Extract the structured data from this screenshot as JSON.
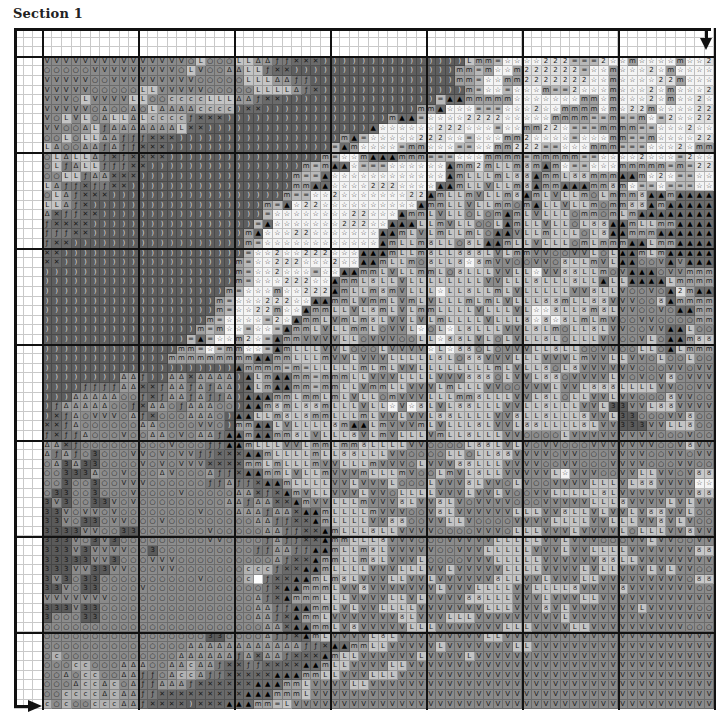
{
  "header": {
    "title": "Section 1"
  },
  "chart": {
    "cell_px": 9.6,
    "margin_cols": 3,
    "margin_rows": 3,
    "cols": 70,
    "rows": 68,
    "bold_every": 10,
    "arrows": {
      "top_right": "down-arrow",
      "bottom_left": "right-arrow"
    }
  },
  "legend": {
    "v": {
      "glyph": "V",
      "bg": "#8a8a8a",
      "name": "v-symbol"
    },
    "o": {
      "glyph": "○",
      "bg": "#8c8c8c",
      "name": "circle-symbol"
    },
    "l": {
      "glyph": "L",
      "bg": "#c4c4c4",
      "name": "l-symbol"
    },
    "a": {
      "glyph": "Δ",
      "bg": "#9a9a9a",
      "name": "triangle-outline-symbol"
    },
    "f": {
      "glyph": "ƒ",
      "bg": "#7a7a7a",
      "name": "f-symbol"
    },
    "x": {
      "glyph": "✕",
      "bg": "#6a6a6a",
      "name": "cross-symbol"
    },
    "c": {
      "glyph": "c",
      "bg": "#b2b2b2",
      "name": "c-symbol"
    },
    ")": {
      "glyph": ")",
      "bg": "#5e5e5e",
      "name": "paren-symbol"
    },
    "m": {
      "glyph": "m",
      "bg": "#a0a0a0",
      "name": "m-symbol"
    },
    "=": {
      "glyph": "=",
      "bg": "#b8b8b8",
      "name": "equals-symbol"
    },
    "s": {
      "glyph": "☆",
      "bg": "#f4f4f4",
      "name": "star-symbol"
    },
    "2": {
      "glyph": "2",
      "bg": "#dedede",
      "name": "two-symbol"
    },
    "^": {
      "glyph": "▲",
      "bg": "#6c6c6c",
      "name": "filled-triangle-symbol"
    },
    "5": {
      "glyph": "ठ",
      "bg": "#c8c8c8",
      "name": "curl-symbol"
    },
    "3": {
      "glyph": "3",
      "bg": "#5a5a5a",
      "name": "three-symbol"
    },
    ".": {
      "glyph": "",
      "bg": "#ffffff",
      "name": "empty"
    }
  },
  "pattern_rows": [
    "vvvvvvvvvvvvvvvolooollaaffxxx)))))))))))))))lmm=ssss222===2ssmssssmss2ss2",
    "ooooovvvvvvvvvolvooaallfxx)))))))))))))))))mm=mssm222222=ssmsss2smssss2",
    "vvvvvoovvvvvvvvvooooolllaaff)))))))))))))))mm=ssmm2222222ssmssss22msss2",
    "vvvvvooooollvvvvvooooollllafx)))))))))))))))m=ss=sssm==2sssmsss2smsss2",
    "vvvolvvvvlloocccclllaafxx))))))))))))))))=^^mmmmmsssssssmmsmsss2smss2s",
    "vvvvvoaooaolaaaacccc)xx))))))))))))))))mm^sss===sss2ssmmmmsms22mssss2",
    "volvloallalccccfxxx)))))))))))))))))m^^=ssss2222sssssmmmm==m==ms=2ss2",
    "vvooalfaaaaaaalxx)))))))))))))))))^ssssss222sss=ssmm22s===mmmm==sss2s",
    "oolollaafffxxx)))))))))))))))))m^=sssss222ss=sssmm2ssss=sssmm==mssss2",
    "laooaafaffxxx)))))))))))))))))=^mssss=mmsss==ssmm222==sssmmm===sss2sm",
    "olallafxfxxxx))))))))))))))))m=ssm^^^mmm===sssmmmm=mmmmm==ssss2sss=2s",
    "olfallfffxx))))))))))))))))m=m^^s===ssssss^mm2mllm5m^ms==sssmmmmm=m=2",
    "oollfaaxxx))))))))))))))))m==^ssssssssssss^mlllml55^mml55mmm^^ms2s==s",
    "laffxffxx)))))))))))))))))mm^^ssss222ssss^^mllvllm5^mm^^^mm5ms==s===s",
    "olafxxx))))))))))))))))))m==ss2sssssss22^mllmvllm5^mlvllmolmmm5^^m^^^",
    "llafx))))))))))))))))))m=^s22ssssssssss^mmllvllmmom^llvllmomm55^m^^^^",
    "axffxx)))))))))))))))))=ssssssss22sss^mmlvllolom^mlvlllommomlm^^^^^^",
    "fxxxx)))))))))))))))))=^sssssss222ss^^^llmvllool^mllvllol55^^mllmm^^^",
    "fffxx))))))))))))))))m^sss22sssssss^^mlvlmllmlo^^vllmlllol5^^mmm^^^^",
    "fxx))))))))))))))))))m=ssssssssssss^mllm5llo5l^^mllvlllomlmmm^^lmm^^^",
    "xx)))))))))))))))))))=ss2ss222sss^^^mllm5ll555lvlmmvvoovvlol^^mlm^^^^",
    "xx))))))))))))))))))m=ss222sss2ss^^mllmo5ll5s5mvvoovvo5llmvl^^oov^v^^",
    "))))))))))))))))))))m=ss2sss=ss^^mmlvllmmlo5lllvvllsvv55llmov^^^ovvmm",
    "))))))))))))))))))))m=sss222ss^mml5llvllllllllvvlll5lll5ll^ll^^^^lmmm",
    ")))))))))))))))))))m=sssmss222^mllm5mvlllsll5llmlvlllllvv5llvoovo^2m^",
    "))))))))))))))))))m=sss222ss^^mmlvmmlvmlvlllmlmlvlll55mll55vvvoo5^mmm",
    "))))))))))))))))))m=ss22mss^mmllvl5mlvlmmllllvlllvlss5ll5m5lvvoovo^^m",
    ")))))))))))))))))m=ssss=2s^mmlvmlm5lvvlvlmllllvlll5s5s5lmlmvoovvoooom",
    "))))))))))))))))m=mss=ss=^mmlvllmmlovvlsolsl5lllvvl5lmoll5lvvoovv^^lo",
    ")))))))))))))))=^=ssm2s=^mmvvvvllovvvoolls55lvlolvll5lolllvvoovlo^^m5",
    "))))))))))))))mm=s=mmss=^mlllvvlooolvvvvsls55olovvvll5lloovvoollo^lmm",
    ")))))))))))))mmmmmmmmm^^mmlllmvvlvvvlllll5lo55vvvlllvvvlmvvllvvoloolo",
    "))))))))))))))))))))^mmmm=m=lllllmlmlvvllllllllmlvll5ol5vvvvvvooovvov",
    "))))))))aaf))aaxaaaa)^lm^^mm=mmmllvvvllllvvv555olvvl55ovvvvlvovov5ovv",
    "))))ffffaaxxfaafafaa)^lm^^mm=mmllvmmllvvvlmlllvvoovvvlvvl555llllvvoov",
    ")))aaaaaoofxfaafaffa)^^^mmlmmlmlvllomvvvlllmm5lllvvl5lollvvlvvooo5vvo",
    ")faaaaaoofxaaofaaaoo)^^m5ml55mlllvllsvs5lvl55lllvvll5lllvvl33vvl55vvv",
    ")xfaovvvoafxoooaaao)^^llm5l5mmlllmlvvlvvl55llllvv5ll5lll5vvl33ooovv5o",
    "xxfaooooooaaoooovvo)mm^^lvllll5m^^lmvvvmlvlll5lvvl55llll5lvv333vvll5o",
    "fxffaooovooaaovoaaf^^m^^mm5lvlll5vlmvlllvmll5lllvvoooolvvvvvvvvvooovo",
    "aaxfooooooooovoooff^^mlllvvlmmlmm5llllvvooool55lvlvovvooovvvvvvvoov5v",
    "afafo3ooovvovovvffxxx^^mllllmll55lllvvoooolloll55vvvvovvooovvvvoovvov",
    "oa3a33oooovovovvvxxxxmmlmlllmvvlllmvvvolvvv55lllvvvvoovvooovvvvooovvo",
    "oo333aoovoooavoooaffx^^mmlvllmvvvmlllmvoolmvl5llvvvvvlsvvvoovvllvvov5",
    "oo3oo3oovvvooooooffaffx^^mllllvvlvvvlooolvvv5lvvolvoovvvvlllvl55vvvvs",
    "o33oo3ooovoooovoooooaaxfx^mvllvvvlvvollllvvvlvvlvoovvlllll5lvvvvvvvv5",
    "3v3oo33vovoooooooooaafaaxx^mvvlllmvvv5lvv5lvovvvvooovvvvvlll5vvvvlvlv",
    "33vovvovoooooooovoooaaafaax^^mllllmvvvoov5lvvvvvvlllvv5llvlvvlv55vvlo",
    "33vo33ovvooovoooooooooaaffxx^mllllvv55oovvllvoooovvvvllllvvlllvv5vlvo",
    "3333vvoo33ooooooovoooooaaffxx^mlll5llvvvvoooovvvolllvvvlvvvvlolllvv5v",
    "333vo3v3ooooooooovvoooofaffxx^mmlll5vvvooovvvvvlllllvvlvvvooovvlvvoov",
    "333v3vvvvoo3ooooooooooffaaff^^mllm5lvvvvvoovvvlllllvvvlvvllllvvvvvvv5",
    "33333vv3ooovvvooooooooooafxx^mmllm5lvvvloooovvvlllllvvvvvv55llvvvvvvv",
    "333vv33vvooovvooooooocccfxx^^mllllvvvlllvvlvvvvvllllvvvvlvllvvvlvlvvo",
    "3v3o33oooooooooovooooc6fxx^^mlm5lvvvllvvlvvvvvv5llvvlvvvllvvvvvvvvvo5",
    "33vo33oooovoooooooooooofx^^mmmlvv5vvvvvvvlvvvllllvvllll5vvvv5vvvvvvvo",
    "vvvvvvvoooooooooooooooafx^mmmlllvvvvllvlvvvv55lllvvvlvvvllvvvvvvvvvvv",
    "333v33ooooooooooooooooaaff^^mmlvlvvllllvvvvvvvlllvvv5vlvvvvvvvlvvvvvo",
    "3ooo33ooooooooooooooooaafx^mmlvvvvvvv5lvvvlllvvvvvvvvvlvvvvvvvvvvvvv",
    "oooooooooooooooooooooooaax^^mmlv5vvvvvlllvvvvvvvlllvvvvllvvvvvvvvvvo",
    "ooooooooooooooooo33ooooaffx^mlvvvvl5lvvvvvvvvvllvvvvvvvvvvvvvvvvvvvv",
    "oooooooooooooooaaaaaaaaaaaaffx^^mmllvvvvvlvvvvvvvllvvvvvvvvvvvvvvvvv",
    "ocooooooooooooaaaaaafaxaafxxx^mllvvvvvvlvvvvlvvvvvvvvvvvvvvvvvvvvvvv",
    "oooccoooaaaooaacaafxxffxxxx^^mllvvvvllvvvvvvvvvvvvvvvvvvvvvvvvvvvvvvv",
    "ooaoccooaaffoaccaffxxxxx^^^mmllvvvlllvvvvvvvvvvvvvvvvvvvvvvvvvvvvvvvv",
    "oooaccacoaffaaafxxxxxx^^^mmlvvvvllvvvvvvvvvvvvvvvvvvvvvvvvvvvvvvvvvvv",
    "ooccccacaaffxxxxxxxxx^^^mmmlvvvvvvvvvvvvvvvvvvvvvvvvvvvvvvvvvvvvvvvvv",
    "cocoocccaafxxxx)xxx^^^mm=lvvvvvvvvvvvvvvvvvvvvvvvvvvvvvvvvvvvvvvvvvvv"
  ]
}
